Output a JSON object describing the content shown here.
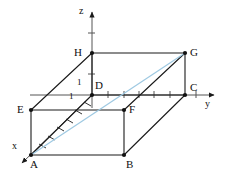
{
  "figure": {
    "background_color": "#ffffff",
    "line_color": "#1a1a1a",
    "diagonal_color": "#9ec9e2",
    "label_color": "#101010",
    "width": 228,
    "height": 178
  },
  "axes": [
    {
      "name": "z-axis",
      "label": "z",
      "label_x": 79,
      "label_y": 7,
      "direction": "up"
    },
    {
      "name": "y-axis",
      "label": "y",
      "label_x": 205,
      "label_y": 99,
      "direction": "right"
    },
    {
      "name": "x-axis",
      "label": "x",
      "label_x": 13,
      "label_y": 142,
      "direction": "down-left"
    }
  ],
  "unit_marks": [
    {
      "name": "unit-z",
      "label": "1",
      "x": 77,
      "y": 78
    },
    {
      "name": "unit-x",
      "label": "1",
      "x": 70,
      "y": 92
    }
  ],
  "vertices": [
    {
      "name": "A",
      "label": "A",
      "px": 31,
      "py": 155,
      "label_x": 30,
      "label_y": 160
    },
    {
      "name": "B",
      "label": "B",
      "px": 124,
      "py": 155,
      "label_x": 126,
      "label_y": 160
    },
    {
      "name": "C",
      "label": "C",
      "px": 185,
      "py": 95,
      "label_x": 190,
      "label_y": 83
    },
    {
      "name": "D",
      "label": "D",
      "px": 92,
      "py": 95,
      "label_x": 95,
      "label_y": 81
    },
    {
      "name": "E",
      "label": "E",
      "px": 31,
      "py": 110,
      "label_x": 18,
      "label_y": 105
    },
    {
      "name": "F",
      "label": "F",
      "px": 124,
      "py": 110,
      "label_x": 129,
      "label_y": 105
    },
    {
      "name": "G",
      "label": "G",
      "px": 185,
      "py": 53,
      "label_x": 190,
      "label_y": 48
    },
    {
      "name": "H",
      "label": "H",
      "px": 92,
      "py": 53,
      "label_x": 74,
      "label_y": 48
    }
  ],
  "edges": [
    {
      "name": "edge-A-B",
      "from": "A",
      "to": "B",
      "style": "solid"
    },
    {
      "name": "edge-B-C",
      "from": "B",
      "to": "C",
      "style": "solid"
    },
    {
      "name": "edge-A-E",
      "from": "A",
      "to": "E",
      "style": "solid"
    },
    {
      "name": "edge-E-F",
      "from": "E",
      "to": "F",
      "style": "solid"
    },
    {
      "name": "edge-F-B",
      "from": "F",
      "to": "B",
      "style": "solid"
    },
    {
      "name": "edge-E-H",
      "from": "E",
      "to": "H",
      "style": "solid"
    },
    {
      "name": "edge-H-G",
      "from": "H",
      "to": "G",
      "style": "solid"
    },
    {
      "name": "edge-G-C",
      "from": "G",
      "to": "C",
      "style": "solid"
    },
    {
      "name": "edge-G-F",
      "from": "G",
      "to": "F",
      "style": "solid"
    },
    {
      "name": "edge-H-D",
      "from": "H",
      "to": "D",
      "style": "solid"
    },
    {
      "name": "edge-D-C",
      "from": "D",
      "to": "C",
      "style": "solid"
    },
    {
      "name": "edge-D-A",
      "from": "D",
      "to": "A",
      "style": "solid"
    }
  ],
  "diagonals": [
    {
      "name": "diagonal-A-G",
      "from": "A",
      "to": "G",
      "color": "#9ec9e2"
    }
  ]
}
